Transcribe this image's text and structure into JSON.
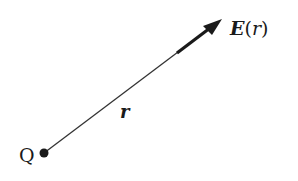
{
  "diagram": {
    "type": "electric-field-of-point-charge",
    "charge_label": "Q",
    "position_vector_label": "r",
    "field_label": {
      "symbol": "E",
      "open": "(",
      "arg": "r",
      "close": ")"
    },
    "colors": {
      "ink": "#1a1a1a",
      "background": "#ffffff"
    }
  }
}
